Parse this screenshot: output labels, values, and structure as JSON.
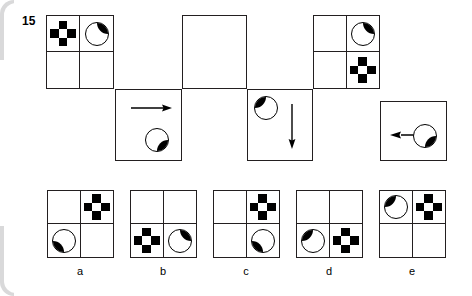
{
  "question": {
    "number": "15",
    "type": "visual-analogy-sequence"
  },
  "colors": {
    "ink": "#231f20",
    "fill": "#000000",
    "paper": "#ffffff",
    "page_edge": "#d9d9da"
  },
  "sequence": {
    "top_boxes": [
      {
        "name": "box-1",
        "cells": {
          "top_left": "cross",
          "top_right": "pie-top-right-black",
          "bottom_left": "empty",
          "bottom_right": "empty"
        }
      },
      {
        "name": "box-2",
        "cells": {
          "top_left": "empty",
          "top_right": "empty",
          "bottom_left": "empty",
          "bottom_right": "empty"
        }
      },
      {
        "name": "box-3",
        "cells": {
          "top_left": "empty",
          "top_right": "pie-top-right-black",
          "bottom_left": "empty",
          "bottom_right": "cross"
        }
      }
    ],
    "bottom_boxes": [
      {
        "name": "box-a",
        "arrow": "arrow-right",
        "pie": "pie-bottom-right-black",
        "pie_position": "bottom-right"
      },
      {
        "name": "box-b",
        "arrow": "arrow-down",
        "pie": "pie-top-left-black",
        "pie_position": "top-left"
      },
      {
        "name": "box-c",
        "arrow": "arrow-left",
        "pie": "pie-bottom-right-black",
        "pie_position": "right"
      }
    ]
  },
  "options": [
    {
      "label": "a",
      "cells": {
        "top_left": "empty",
        "top_right": "cross",
        "bottom_left": "pie-bottom-left-black",
        "bottom_right": "empty"
      }
    },
    {
      "label": "b",
      "cells": {
        "top_left": "empty",
        "top_right": "empty",
        "bottom_left": "cross",
        "bottom_right": "pie-top-right-black"
      }
    },
    {
      "label": "c",
      "cells": {
        "top_left": "empty",
        "top_right": "cross",
        "bottom_left": "empty",
        "bottom_right": "pie-bottom-left-black"
      }
    },
    {
      "label": "d",
      "cells": {
        "top_left": "empty",
        "top_right": "empty",
        "bottom_left": "pie-top-left-black",
        "bottom_right": "cross"
      }
    },
    {
      "label": "e",
      "cells": {
        "top_left": "pie-top-left-black",
        "top_right": "cross",
        "bottom_left": "empty",
        "bottom_right": "empty"
      }
    }
  ]
}
